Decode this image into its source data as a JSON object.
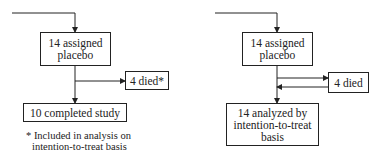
{
  "left": {
    "assigned": "14 assigned placebo",
    "assigned_l1": "14 assigned",
    "assigned_l2": "placebo",
    "died": "4 died*",
    "completed": "10 completed study",
    "footnote_l1": "* Included in analysis on",
    "footnote_l2": "intention-to-treat basis"
  },
  "right": {
    "assigned_l1": "14 assigned",
    "assigned_l2": "placebo",
    "died": "4 died",
    "analyzed_l1": "14 analyzed by",
    "analyzed_l2": "intention-to-treat",
    "analyzed_l3": "basis"
  }
}
